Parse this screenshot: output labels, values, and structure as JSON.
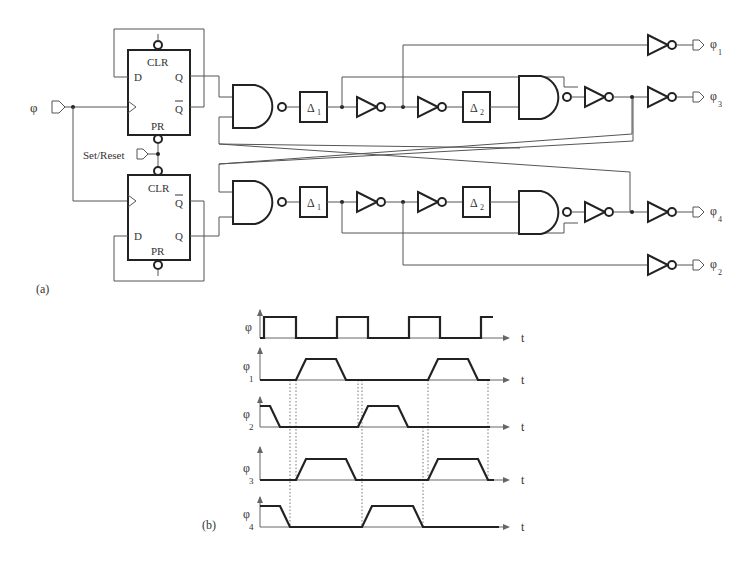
{
  "figure": {
    "part_a_label": "(a)",
    "part_b_label": "(b)"
  },
  "circuit": {
    "input_label": "φ",
    "set_reset_label": "Set/Reset",
    "flipflop_top": {
      "clr": "CLR",
      "pr": "PR",
      "d": "D",
      "q": "Q",
      "qbar": "Q"
    },
    "flipflop_bottom": {
      "clr": "CLR",
      "pr": "PR",
      "d": "D",
      "q": "Q",
      "qbar": "Q"
    },
    "delay_labels": {
      "d1": "Δ",
      "d1_sub": "1",
      "d2": "Δ",
      "d2_sub": "2"
    },
    "outputs": [
      {
        "symbol": "φ",
        "sub": "1"
      },
      {
        "symbol": "φ",
        "sub": "3"
      },
      {
        "symbol": "φ",
        "sub": "4"
      },
      {
        "symbol": "φ",
        "sub": "2"
      }
    ]
  },
  "timing": {
    "axis_label": "t",
    "signals": [
      {
        "symbol": "φ",
        "sub": ""
      },
      {
        "symbol": "φ",
        "sub": "1"
      },
      {
        "symbol": "φ",
        "sub": "2"
      },
      {
        "symbol": "φ",
        "sub": "3"
      },
      {
        "symbol": "φ",
        "sub": "4"
      }
    ]
  }
}
